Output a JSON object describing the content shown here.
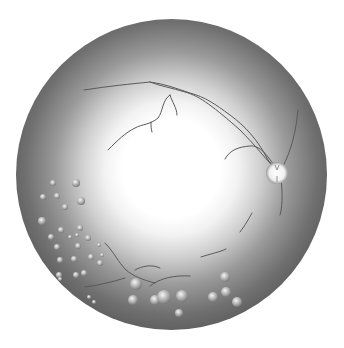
{
  "image": {
    "subject": "retinal-fundus",
    "colors": {
      "background": "#ffffff",
      "center": "#ffffff",
      "edge": "#3a3a3a",
      "vessel": "#555555",
      "drusen": "#b8b8b8"
    },
    "fundus": {
      "cx": 172,
      "cy": 175,
      "r": 155
    },
    "optic_disc": {
      "cx": 277,
      "cy": 173,
      "r": 11
    },
    "drusen": [
      [
        53,
        183,
        3
      ],
      [
        76,
        183,
        4
      ],
      [
        43,
        197,
        3
      ],
      [
        57,
        196,
        3
      ],
      [
        81,
        201,
        4
      ],
      [
        65,
        207,
        3
      ],
      [
        42,
        221,
        4
      ],
      [
        61,
        230,
        3
      ],
      [
        80,
        228,
        3
      ],
      [
        51,
        237,
        3
      ],
      [
        70,
        237,
        2
      ],
      [
        77,
        235,
        2
      ],
      [
        88,
        238,
        3
      ],
      [
        57,
        247,
        3
      ],
      [
        78,
        246,
        3
      ],
      [
        99,
        245,
        2
      ],
      [
        102,
        255,
        2
      ],
      [
        60,
        260,
        3
      ],
      [
        74,
        259,
        3
      ],
      [
        91,
        257,
        3
      ],
      [
        100,
        263,
        3
      ],
      [
        59,
        275,
        3
      ],
      [
        76,
        275,
        3
      ],
      [
        84,
        273,
        3
      ],
      [
        60,
        279,
        2
      ],
      [
        89,
        297,
        2
      ],
      [
        94,
        302,
        2
      ],
      [
        136,
        284,
        6
      ],
      [
        133,
        300,
        5
      ],
      [
        155,
        300,
        5
      ],
      [
        164,
        297,
        7
      ],
      [
        182,
        296,
        6
      ],
      [
        179,
        313,
        4
      ],
      [
        213,
        297,
        5
      ],
      [
        225,
        277,
        5
      ],
      [
        226,
        292,
        5
      ],
      [
        237,
        302,
        5
      ]
    ]
  }
}
